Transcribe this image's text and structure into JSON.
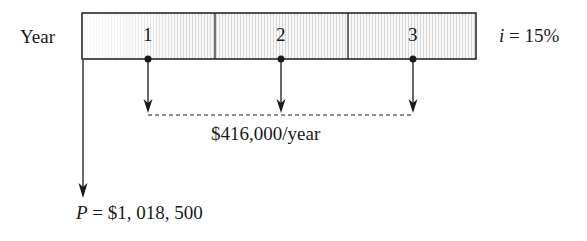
{
  "diagram": {
    "type": "cash-flow-diagram",
    "axis_label": "Year",
    "interest_label_var": "i",
    "interest_label_value": " = 15%",
    "periods": [
      {
        "label": "1"
      },
      {
        "label": "2"
      },
      {
        "label": "3"
      }
    ],
    "annuity_label": "$416,000/year",
    "present_var": "P",
    "present_value": " = $1, 018, 500",
    "colors": {
      "line": "#1a1a1a",
      "shade_light": "#f4f4f4",
      "shade_dark": "#e4e4e4",
      "background": "#ffffff"
    }
  }
}
